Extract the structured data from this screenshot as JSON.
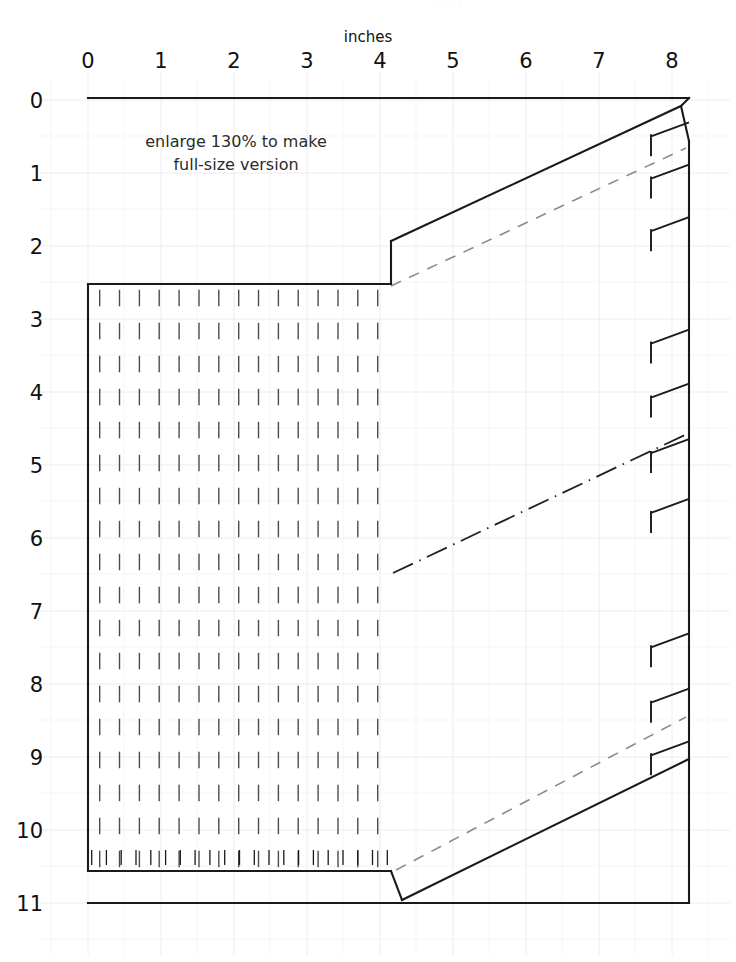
{
  "document": {
    "kind": "sewing-pattern-diagram",
    "background_color": "#ffffff",
    "ink_color": "#1a1a1a",
    "grid_color": "#efeff2",
    "dash_color": "#7d7d86"
  },
  "header": {
    "faint_cropped_line": "·  ·   ·    ·     ·"
  },
  "ruler": {
    "unit_title": "inches",
    "x_labels": [
      "0",
      "1",
      "2",
      "3",
      "4",
      "5",
      "6",
      "7",
      "8"
    ],
    "y_labels": [
      "0",
      "1",
      "2",
      "3",
      "4",
      "5",
      "6",
      "7",
      "8",
      "9",
      "10",
      "11"
    ],
    "pixels_per_inch": 73,
    "x_origin_px": 88,
    "y_origin_px": 100
  },
  "annotation": {
    "line1": "enlarge 130% to make",
    "line2": "full-size version"
  },
  "chart_data": {
    "type": "line",
    "xlabel": "inches",
    "ylabel": "inches",
    "xlim": [
      0,
      8.9
    ],
    "ylim": [
      0,
      11.8
    ],
    "grid": true,
    "legend": "none",
    "series": [
      {
        "name": "pattern-outline",
        "style": "solid",
        "color": "#1a1a1a",
        "points_in": [
          [
            0.0,
            0.0
          ],
          [
            8.22,
            0.0
          ],
          [
            8.12,
            0.08
          ],
          [
            8.22,
            0.56
          ],
          [
            4.14,
            2.44
          ],
          [
            4.14,
            2.51
          ],
          [
            0.0,
            2.51
          ],
          [
            0.0,
            10.48
          ],
          [
            4.14,
            10.48
          ],
          [
            4.29,
            11.06
          ],
          [
            8.22,
            8.96
          ],
          [
            8.22,
            11.06
          ],
          [
            0.0,
            11.06
          ]
        ]
      },
      {
        "name": "upper-seam-allowance",
        "style": "dashed",
        "color": "#7d7d86",
        "points_in": [
          [
            4.16,
            2.55
          ],
          [
            8.2,
            0.66
          ]
        ]
      },
      {
        "name": "center-fold-line",
        "style": "dash-dot",
        "color": "#1a1a1a",
        "points_in": [
          [
            4.18,
            6.48
          ],
          [
            8.21,
            4.58
          ]
        ]
      },
      {
        "name": "lower-seam-allowance",
        "style": "dashed",
        "color": "#7d7d86",
        "points_in": [
          [
            4.23,
            10.55
          ],
          [
            8.2,
            8.45
          ]
        ]
      }
    ],
    "hatch_region": {
      "name": "gathering-hatch",
      "style": "vertical-dash-grid",
      "x_range_in": [
        0.16,
        4.02
      ],
      "y_range_in": [
        2.6,
        10.4
      ],
      "col_spacing_in": 0.272,
      "row_spacing_in": 0.452
    },
    "notches": {
      "name": "right-edge-notches",
      "count": 8,
      "style": "flag-tick",
      "y_in": [
        0.62,
        1.2,
        1.92,
        3.46,
        4.2,
        4.96,
        5.78,
        7.62,
        8.38,
        9.1
      ]
    },
    "bottom_ticks": {
      "name": "bottom-edge-ticks",
      "count": 21,
      "x_start_in": 0.05,
      "x_end_in": 4.1,
      "y_in": 10.48
    }
  },
  "grid": {
    "minor_color": "#f4f4f6",
    "major_color": "#eaeaef"
  }
}
